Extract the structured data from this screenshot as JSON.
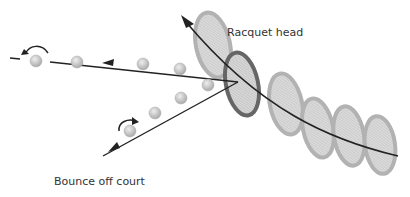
{
  "diagram": {
    "labels": {
      "racquet_head": "Racquet head",
      "bounce": "Bounce off court"
    },
    "colors": {
      "racquet_light": "#bdbdbd",
      "racquet_dark": "#6e6e6e",
      "ball": "#c8c8c8",
      "line": "#222222"
    }
  }
}
